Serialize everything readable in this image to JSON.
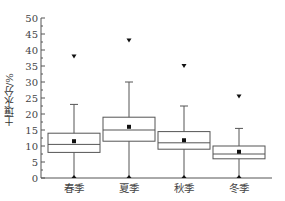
{
  "chart_data": {
    "type": "box",
    "title": "",
    "xlabel": "",
    "ylabel": "土壤水分/%",
    "ylim": [
      0,
      50
    ],
    "yticks": [
      0,
      5,
      10,
      15,
      20,
      25,
      30,
      35,
      40,
      45,
      50
    ],
    "grid": false,
    "legend": null,
    "categories": [
      "春季",
      "夏季",
      "秋季",
      "冬季"
    ],
    "series": [
      {
        "name": "春季",
        "min": 0,
        "q1": 8,
        "median": 10.5,
        "q3": 14,
        "whisker_high": 23,
        "mean": 11.5,
        "outlier_high": 38
      },
      {
        "name": "夏季",
        "min": 0,
        "q1": 11.5,
        "median": 15,
        "q3": 19,
        "whisker_high": 30,
        "mean": 16,
        "outlier_high": 43
      },
      {
        "name": "秋季",
        "min": 0,
        "q1": 9,
        "median": 11,
        "q3": 14.5,
        "whisker_high": 22.5,
        "mean": 11.8,
        "outlier_high": 35
      },
      {
        "name": "冬季",
        "min": 0,
        "q1": 6,
        "median": 7.5,
        "q3": 10,
        "whisker_high": 15.5,
        "mean": 8.2,
        "outlier_high": 25.5
      }
    ]
  }
}
